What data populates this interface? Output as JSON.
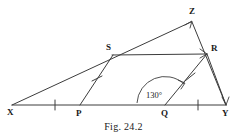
{
  "figure": {
    "caption": "Fig. 24.2",
    "background_color": "#ffffff",
    "ink_color": "#3c3c3c",
    "text_color": "#1a1a1a",
    "vertices": {
      "X": {
        "label": "X",
        "x": 12,
        "y": 105,
        "label_x": 7,
        "label_y": 115
      },
      "P": {
        "label": "P",
        "x": 80,
        "y": 105,
        "label_x": 76,
        "label_y": 116
      },
      "Q": {
        "label": "Q",
        "x": 165,
        "y": 105,
        "label_x": 161,
        "label_y": 116
      },
      "Y": {
        "label": "Y",
        "x": 226,
        "y": 105,
        "label_x": 223,
        "label_y": 116
      },
      "S": {
        "label": "S",
        "x": 112,
        "y": 55,
        "label_x": 107,
        "label_y": 50
      },
      "R": {
        "label": "R",
        "x": 207,
        "y": 53,
        "label_x": 212,
        "label_y": 51
      },
      "Z": {
        "label": "Z",
        "x": 192,
        "y": 21,
        "label_x": 190,
        "label_y": 13
      }
    },
    "segments": [
      {
        "name": "base-line-XY",
        "from": "X",
        "to": "Y"
      },
      {
        "name": "ray-XZ",
        "from": "X",
        "to": "Z"
      },
      {
        "name": "segment-ZY",
        "from": "Z",
        "to": "Y"
      },
      {
        "name": "segment-SR",
        "from": "S",
        "to": "R"
      },
      {
        "name": "segment-PS",
        "from": "P",
        "to": "S"
      },
      {
        "name": "segment-QR",
        "from": "Q",
        "to": "R"
      },
      {
        "name": "segment-RY",
        "from": "R",
        "to": "Y"
      }
    ],
    "tick_marks": [
      {
        "name": "tick-XP",
        "x": 55,
        "y": 105,
        "orientation": "vertical"
      },
      {
        "name": "tick-QY",
        "x": 198,
        "y": 105,
        "orientation": "vertical"
      },
      {
        "name": "tick-PS",
        "x": 97,
        "y": 79,
        "orientation": "cross-segment"
      },
      {
        "name": "tick-QR",
        "x": 190,
        "y": 77,
        "orientation": "cross-segment"
      }
    ],
    "angle": {
      "name": "angle-at-Q",
      "value": "130°",
      "vertex": "Q",
      "label_x": 152,
      "label_y": 95,
      "radius": 30
    }
  }
}
